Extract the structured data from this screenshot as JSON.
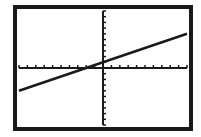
{
  "chart_data": {
    "type": "line",
    "title": "",
    "xlabel": "",
    "ylabel": "",
    "xlim": [
      -10,
      10
    ],
    "ylim": [
      -10,
      10
    ],
    "xscl": 1,
    "yscl": 1,
    "grid": false,
    "series": [
      {
        "name": "Y1",
        "equation": "y = 0.5x + 1",
        "slope": 0.5,
        "intercept": 1,
        "x": [
          -10,
          10
        ],
        "y": [
          -4,
          6
        ]
      }
    ]
  },
  "colors": {
    "ink": "#1a1a1a",
    "background": "#ffffff"
  }
}
